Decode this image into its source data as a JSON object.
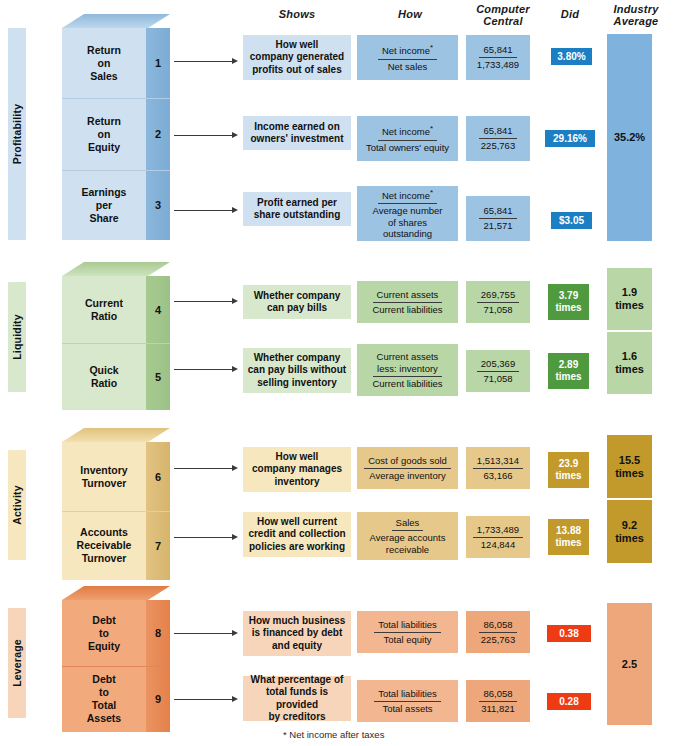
{
  "headers": {
    "shows": "Shows",
    "how": "How",
    "computer_central_l1": "Computer",
    "computer_central_l2": "Central",
    "did": "Did",
    "industry_l1": "Industry",
    "industry_l2": "Average"
  },
  "footnote": "* Net income after taxes",
  "colors": {
    "profitability_light": "#cfe0f0",
    "profitability_mid": "#9dc3e3",
    "profitability_dark": "#6da8d4",
    "profitability_top": "#b9d4ea",
    "profitability_badge": "#1c7fc4",
    "liquidity_light": "#d8e8cd",
    "liquidity_mid": "#b9d6a6",
    "liquidity_dark": "#9dc287",
    "liquidity_top": "#c9e0b8",
    "liquidity_badge": "#4f9a3e",
    "activity_light": "#f6e7bf",
    "activity_mid": "#e6c98a",
    "activity_dark": "#d4b56c",
    "activity_top": "#f0dba6",
    "activity_badge": "#c29a2b",
    "leverage_light": "#f6d5bb",
    "leverage_mid": "#eda77a",
    "leverage_dark": "#e8864f",
    "leverage_top": "#f2b791",
    "leverage_badge": "#ef3b13"
  },
  "sections": [
    {
      "category": "Profitability",
      "industry_average": "35.2%",
      "industry_average_unit": "",
      "rows": [
        {
          "num": "1",
          "name_lines": [
            "Return",
            "on",
            "Sales"
          ],
          "shows": [
            "How well",
            "company generated",
            "profits out of sales"
          ],
          "numerator": "Net income",
          "numerator_star": true,
          "denominator_lines": [
            "Net sales"
          ],
          "cc_top": "65,841",
          "cc_bottom": "1,733,489",
          "did": "3.80%",
          "did_unit": ""
        },
        {
          "num": "2",
          "name_lines": [
            "Return",
            "on",
            "Equity"
          ],
          "shows": [
            "Income earned on",
            "owners' investment"
          ],
          "numerator": "Net income",
          "numerator_star": true,
          "denominator_lines": [
            "Total owners' equity"
          ],
          "cc_top": "65,841",
          "cc_bottom": "225,763",
          "did": "29.16%",
          "did_unit": ""
        },
        {
          "num": "3",
          "name_lines": [
            "Earnings",
            "per",
            "Share"
          ],
          "shows": [
            "Profit earned per",
            "share outstanding"
          ],
          "numerator": "Net income",
          "numerator_star": true,
          "denominator_lines": [
            "Average number",
            "of shares",
            "outstanding"
          ],
          "cc_top": "65,841",
          "cc_bottom": "21,571",
          "did": "$3.05",
          "did_unit": ""
        }
      ]
    },
    {
      "category": "Liquidity",
      "industry_average": "",
      "industry_average_unit": "",
      "rows": [
        {
          "num": "4",
          "name_lines": [
            "Current",
            "Ratio"
          ],
          "shows": [
            "Whether company",
            "can pay bills"
          ],
          "numerator": "Current assets",
          "numerator_star": false,
          "denominator_lines": [
            "Current liabilities"
          ],
          "cc_top": "269,755",
          "cc_bottom": "71,058",
          "did": "3.79",
          "did_unit": "times",
          "industry": "1.9",
          "industry_unit": "times"
        },
        {
          "num": "5",
          "name_lines": [
            "Quick",
            "Ratio"
          ],
          "shows": [
            "Whether company",
            "can pay bills without",
            "selling inventory"
          ],
          "numerator": "Current assets",
          "numerator_extra": "less: inventory",
          "numerator_star": false,
          "denominator_lines": [
            "Current liabilities"
          ],
          "cc_top": "205,369",
          "cc_bottom": "71,058",
          "did": "2.89",
          "did_unit": "times",
          "industry": "1.6",
          "industry_unit": "times"
        }
      ]
    },
    {
      "category": "Activity",
      "industry_average": "",
      "industry_average_unit": "",
      "rows": [
        {
          "num": "6",
          "name_lines": [
            "Inventory",
            "Turnover"
          ],
          "shows": [
            "How well",
            "company manages",
            "inventory"
          ],
          "numerator": "Cost of goods sold",
          "numerator_star": false,
          "denominator_lines": [
            "Average inventory"
          ],
          "cc_top": "1,513,314",
          "cc_bottom": "63,166",
          "did": "23.9",
          "did_unit": "times",
          "industry": "15.5",
          "industry_unit": "times"
        },
        {
          "num": "7",
          "name_lines": [
            "Accounts",
            "Receivable",
            "Turnover"
          ],
          "shows": [
            "How well current",
            "credit and collection",
            "policies are working"
          ],
          "numerator": "Sales",
          "numerator_star": false,
          "denominator_lines": [
            "Average accounts",
            "receivable"
          ],
          "cc_top": "1,733,489",
          "cc_bottom": "124,844",
          "did": "13.88",
          "did_unit": "times",
          "industry": "9.2",
          "industry_unit": "times"
        }
      ]
    },
    {
      "category": "Leverage",
      "industry_average": "2.5",
      "industry_average_unit": "",
      "rows": [
        {
          "num": "8",
          "name_lines": [
            "Debt",
            "to",
            "Equity"
          ],
          "shows": [
            "How much business",
            "is financed by debt",
            "and equity"
          ],
          "numerator": "Total liabilities",
          "numerator_star": false,
          "denominator_lines": [
            "Total equity"
          ],
          "cc_top": "86,058",
          "cc_bottom": "225,763",
          "did": "0.38",
          "did_unit": ""
        },
        {
          "num": "9",
          "name_lines": [
            "Debt",
            "to",
            "Total",
            "Assets"
          ],
          "shows": [
            "What percentage of",
            "total funds is provided",
            "by creditors"
          ],
          "numerator": "Total liabilities",
          "numerator_star": false,
          "denominator_lines": [
            "Total assets"
          ],
          "cc_top": "86,058",
          "cc_bottom": "311,821",
          "did": "0.28",
          "did_unit": ""
        }
      ]
    }
  ]
}
